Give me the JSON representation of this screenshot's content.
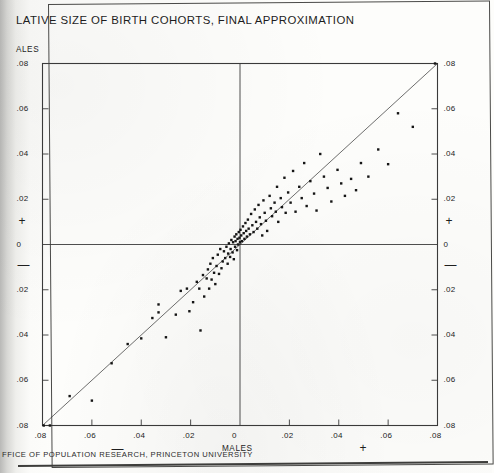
{
  "document": {
    "title_visible": "LATIVE SIZE OF BIRTH COHORTS, FINAL APPROXIMATION",
    "footer_visible": "FFICE OF POPULATION RESEARCH, PRINCETON UNIVERSITY",
    "y_axis_title_visible": "ALES",
    "x_axis_title": "MALES"
  },
  "colors": {
    "ink": "#1d1d1d",
    "axis": "#3a3a3a",
    "point": "#151515",
    "paper": "#fdfdfb",
    "scan_shadow": "#b9b9b7"
  },
  "chart_data": {
    "type": "scatter",
    "title": "LATIVE SIZE OF BIRTH COHORTS, FINAL APPROXIMATION",
    "xlabel": "MALES",
    "ylabel": "ALES",
    "xlim": [
      -0.08,
      0.08
    ],
    "ylim": [
      -0.08,
      0.08
    ],
    "grid": false,
    "legend": null,
    "x_ticks": [
      -0.08,
      -0.06,
      -0.04,
      -0.02,
      0,
      0.02,
      0.04,
      0.06,
      0.08
    ],
    "y_ticks": [
      -0.08,
      -0.06,
      -0.04,
      -0.02,
      0,
      0.02,
      0.04,
      0.06,
      0.08
    ],
    "x_tick_labels": [
      ".08",
      ".06",
      ".04",
      ".02",
      "0",
      ".02",
      ".04",
      ".06",
      ".08"
    ],
    "y_tick_labels": [
      ".08",
      ".06",
      ".04",
      ".02",
      "0",
      ".02",
      ".04",
      ".06",
      ".08"
    ],
    "quadrant_signs": {
      "x_negative": "—",
      "x_positive": "+",
      "y_negative": "—",
      "y_positive": "+"
    },
    "reference_line": {
      "label": "identity line (y = x)",
      "slope": 1,
      "intercept": 0,
      "from": [
        -0.08,
        -0.08
      ],
      "to": [
        0.08,
        0.08
      ]
    },
    "zero_lines": {
      "x": 0,
      "y": 0
    },
    "points": [
      [
        -0.0795,
        -0.08
      ],
      [
        -0.077,
        -0.08
      ],
      [
        -0.069,
        -0.067
      ],
      [
        -0.06,
        -0.069
      ],
      [
        -0.052,
        -0.0525
      ],
      [
        -0.0455,
        -0.044
      ],
      [
        -0.04,
        -0.0415
      ],
      [
        -0.0355,
        -0.0325
      ],
      [
        -0.033,
        -0.03
      ],
      [
        -0.033,
        -0.0265
      ],
      [
        -0.03,
        -0.041
      ],
      [
        -0.026,
        -0.031
      ],
      [
        -0.024,
        -0.0205
      ],
      [
        -0.0215,
        -0.0195
      ],
      [
        -0.0205,
        -0.0295
      ],
      [
        -0.019,
        -0.0255
      ],
      [
        -0.0175,
        -0.0165
      ],
      [
        -0.0165,
        -0.0195
      ],
      [
        -0.016,
        -0.038
      ],
      [
        -0.015,
        -0.0135
      ],
      [
        -0.0145,
        -0.023
      ],
      [
        -0.0135,
        -0.015
      ],
      [
        -0.013,
        -0.011
      ],
      [
        -0.0125,
        -0.0195
      ],
      [
        -0.012,
        -0.0085
      ],
      [
        -0.0115,
        -0.0155
      ],
      [
        -0.011,
        -0.006
      ],
      [
        -0.0105,
        -0.0125
      ],
      [
        -0.01,
        -0.0175
      ],
      [
        -0.0095,
        -0.0095
      ],
      [
        -0.009,
        -0.0045
      ],
      [
        -0.0085,
        -0.013
      ],
      [
        -0.008,
        -0.002
      ],
      [
        -0.0075,
        -0.0105
      ],
      [
        -0.007,
        -0.0075
      ],
      [
        -0.0065,
        -0.003
      ],
      [
        -0.006,
        -0.006
      ],
      [
        -0.0055,
        -0.001
      ],
      [
        -0.005,
        -0.0085
      ],
      [
        -0.0048,
        -0.004
      ],
      [
        -0.0045,
        0.0005
      ],
      [
        -0.004,
        -0.0055
      ],
      [
        -0.0038,
        -0.002
      ],
      [
        -0.0035,
        0.002
      ],
      [
        -0.003,
        -0.0035
      ],
      [
        -0.0028,
        0.001
      ],
      [
        -0.0025,
        -0.0065
      ],
      [
        -0.0022,
        0.0035
      ],
      [
        -0.002,
        -0.001
      ],
      [
        -0.0018,
        0.0015
      ],
      [
        -0.0015,
        0.0045
      ],
      [
        -0.0012,
        -0.0025
      ],
      [
        -0.001,
        0.0025
      ],
      [
        -0.0008,
        0.0
      ],
      [
        -0.0005,
        0.0055
      ],
      [
        -0.0002,
        0.003
      ],
      [
        0.0,
        0.001
      ],
      [
        0.0002,
        0.0065
      ],
      [
        0.0005,
        0.004
      ],
      [
        0.0008,
        0.0015
      ],
      [
        0.0012,
        0.008
      ],
      [
        0.0015,
        0.005
      ],
      [
        0.0018,
        0.0025
      ],
      [
        0.0022,
        0.0095
      ],
      [
        0.0025,
        0.006
      ],
      [
        0.0028,
        0.0035
      ],
      [
        0.0032,
        0.011
      ],
      [
        0.0035,
        0.007
      ],
      [
        0.004,
        0.0045
      ],
      [
        0.0045,
        0.0135
      ],
      [
        0.005,
        0.0085
      ],
      [
        0.0055,
        0.0055
      ],
      [
        0.006,
        0.0155
      ],
      [
        0.0065,
        0.01
      ],
      [
        0.007,
        0.007
      ],
      [
        0.0075,
        0.0175
      ],
      [
        0.008,
        0.012
      ],
      [
        0.0085,
        0.009
      ],
      [
        0.009,
        0.004
      ],
      [
        0.0095,
        0.0195
      ],
      [
        0.01,
        0.014
      ],
      [
        0.0105,
        0.0105
      ],
      [
        0.011,
        0.006
      ],
      [
        0.012,
        0.0215
      ],
      [
        0.0125,
        0.016
      ],
      [
        0.013,
        0.0125
      ],
      [
        0.014,
        0.0185
      ],
      [
        0.0145,
        0.0145
      ],
      [
        0.015,
        0.0255
      ],
      [
        0.0155,
        0.01
      ],
      [
        0.0165,
        0.0205
      ],
      [
        0.017,
        0.0165
      ],
      [
        0.018,
        0.0295
      ],
      [
        0.0185,
        0.014
      ],
      [
        0.0195,
        0.023
      ],
      [
        0.0205,
        0.0185
      ],
      [
        0.0215,
        0.0325
      ],
      [
        0.0225,
        0.0145
      ],
      [
        0.024,
        0.0255
      ],
      [
        0.025,
        0.0205
      ],
      [
        0.026,
        0.036
      ],
      [
        0.027,
        0.017
      ],
      [
        0.0285,
        0.028
      ],
      [
        0.03,
        0.0225
      ],
      [
        0.031,
        0.015
      ],
      [
        0.0325,
        0.04
      ],
      [
        0.034,
        0.03
      ],
      [
        0.0355,
        0.025
      ],
      [
        0.037,
        0.019
      ],
      [
        0.0395,
        0.033
      ],
      [
        0.041,
        0.027
      ],
      [
        0.0425,
        0.0215
      ],
      [
        0.045,
        0.029
      ],
      [
        0.047,
        0.024
      ],
      [
        0.049,
        0.036
      ],
      [
        0.052,
        0.03
      ],
      [
        0.056,
        0.042
      ],
      [
        0.06,
        0.0355
      ],
      [
        0.064,
        0.058
      ],
      [
        0.07,
        0.052
      ],
      [
        0.079,
        0.08
      ]
    ]
  }
}
